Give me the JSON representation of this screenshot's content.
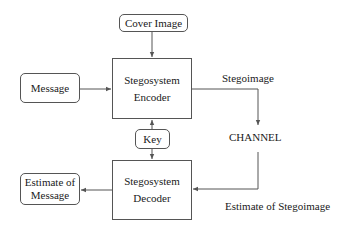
{
  "diagram": {
    "nodes": {
      "cover_image": "Cover Image",
      "message": "Message",
      "encoder_line1": "Stegosystem",
      "encoder_line2": "Encoder",
      "key": "Key",
      "decoder_line1": "Stegosystem",
      "decoder_line2": "Decoder",
      "estimate_message_line1": "Estimate of",
      "estimate_message_line2": "Message"
    },
    "labels": {
      "stegoimage": "Stegoimage",
      "channel": "CHANNEL",
      "estimate_stegoimage": "Estimate of Stegoimage"
    },
    "edges": [
      {
        "from": "Cover Image",
        "to": "Stegosystem Encoder"
      },
      {
        "from": "Message",
        "to": "Stegosystem Encoder"
      },
      {
        "from": "Key",
        "to": "Stegosystem Encoder"
      },
      {
        "from": "Key",
        "to": "Stegosystem Decoder"
      },
      {
        "from": "Stegosystem Encoder",
        "to": "CHANNEL",
        "label": "Stegoimage"
      },
      {
        "from": "CHANNEL",
        "to": "Stegosystem Decoder",
        "label": "Estimate of Stegoimage"
      },
      {
        "from": "Stegosystem Decoder",
        "to": "Estimate of Message"
      }
    ],
    "colors": {
      "line": "#555555",
      "text": "#1a1a1a"
    }
  }
}
